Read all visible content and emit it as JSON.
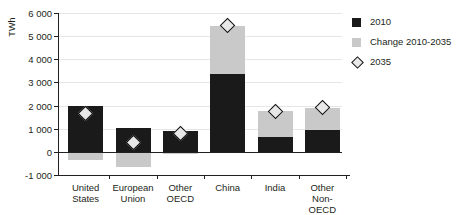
{
  "chart_data": {
    "type": "bar",
    "stacked": true,
    "title": "",
    "xlabel": "",
    "ylabel": "TWh",
    "ylim": [
      -1000,
      6000
    ],
    "ytick_step": 1000,
    "yticks": [
      "6 000",
      "5 000",
      "4 000",
      "3 000",
      "2 000",
      "1 000",
      "0",
      "-1 000"
    ],
    "ytick_values": [
      6000,
      5000,
      4000,
      3000,
      2000,
      1000,
      0,
      -1000
    ],
    "grid": true,
    "legend_position": "right",
    "categories": [
      "United\nStates",
      "European\nUnion",
      "Other\nOECD",
      "China",
      "India",
      "Other\nNon-OECD"
    ],
    "series": [
      {
        "name": "2010",
        "type": "bar",
        "color": "#1a1a1a",
        "values": [
          2000,
          1050,
          900,
          3350,
          650,
          950
        ]
      },
      {
        "name": "Change 2010-2035",
        "type": "bar",
        "color": "#c9c9c9",
        "values": [
          -350,
          -650,
          -100,
          2100,
          1100,
          950
        ]
      },
      {
        "name": "2035",
        "type": "marker",
        "marker": "diamond",
        "color": "#e8e8e8",
        "edge_color": "#111111",
        "values": [
          1650,
          400,
          800,
          5450,
          1750,
          1900
        ]
      }
    ]
  },
  "legend": {
    "items": [
      {
        "label": "2010",
        "swatch": "square-dark"
      },
      {
        "label": "Change 2010-2035",
        "swatch": "square-light"
      },
      {
        "label": "2035",
        "swatch": "diamond-marker"
      }
    ]
  },
  "colors": {
    "base": "#1a1a1a",
    "change": "#c9c9c9",
    "marker_fill": "#e8e8e8",
    "marker_edge": "#111111",
    "axis": "#231f20",
    "grid": "#e6e6e6"
  }
}
